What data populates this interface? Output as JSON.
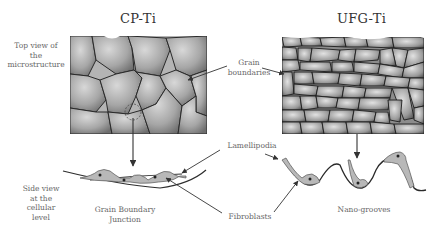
{
  "titles": {
    "left": "CP-Ti",
    "right": "UFG-Ti"
  },
  "labels": {
    "top_view": [
      "Top view of",
      "the",
      "microstructure"
    ],
    "grain_boundaries": [
      "Grain",
      "boundaries"
    ],
    "lamellipodia": "Lamellipodia",
    "side_view": [
      "Side view",
      "at the",
      "cellular",
      "level"
    ],
    "grain_boundary_junction": [
      "Grain Boundary",
      "Junction"
    ],
    "fibroblasts": "Fibroblasts",
    "nano_grooves": "Nano-grooves"
  },
  "colors": {
    "grain_fill": "#a8a8a8",
    "grain_edge": "#2a2a2a",
    "cell_fill": "#b5b5b5",
    "line": "#333333",
    "text": "#666666"
  }
}
